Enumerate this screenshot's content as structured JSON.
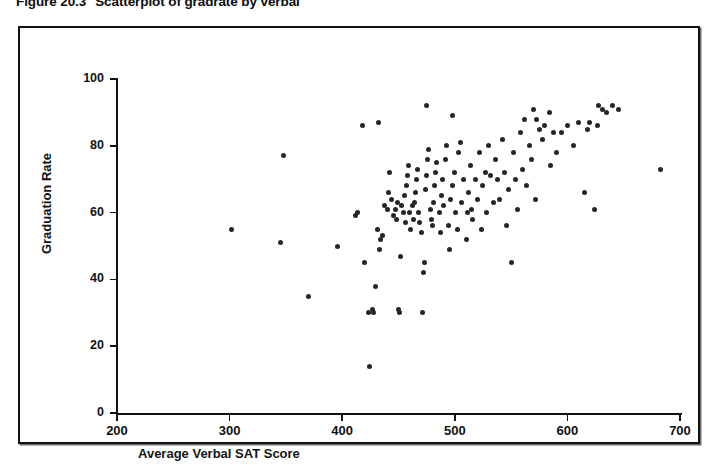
{
  "caption": {
    "number": "Figure 20.3",
    "text": "Scatterplot of gradrate by verbal"
  },
  "chart_data": {
    "type": "scatter",
    "title": "Scatterplot of gradrate by verbal",
    "xlabel": "Average Verbal SAT Score",
    "ylabel": "Graduation Rate",
    "xlim": [
      200,
      700
    ],
    "ylim": [
      0,
      100
    ],
    "xticks": [
      200,
      300,
      400,
      500,
      600,
      700
    ],
    "yticks": [
      0,
      20,
      40,
      60,
      80,
      100
    ],
    "grid": false,
    "legend": "none",
    "marker": {
      "shape": "circle",
      "color": "#262626",
      "size_px": 5
    },
    "n_points": 137,
    "points": [
      [
        348,
        77
      ],
      [
        418,
        86
      ],
      [
        432,
        87
      ],
      [
        475,
        92
      ],
      [
        498,
        89
      ],
      [
        570,
        91
      ],
      [
        573,
        88
      ],
      [
        584,
        90
      ],
      [
        588,
        84
      ],
      [
        628,
        92
      ],
      [
        631,
        91
      ],
      [
        635,
        90
      ],
      [
        640,
        92
      ],
      [
        645,
        91
      ],
      [
        302,
        55
      ],
      [
        370,
        35
      ],
      [
        345,
        51
      ],
      [
        396,
        50
      ],
      [
        412,
        59
      ],
      [
        414,
        60
      ],
      [
        420,
        45
      ],
      [
        423,
        30
      ],
      [
        424,
        14
      ],
      [
        427,
        31
      ],
      [
        428,
        30
      ],
      [
        430,
        38
      ],
      [
        431,
        55
      ],
      [
        433,
        49
      ],
      [
        434,
        52
      ],
      [
        436,
        53
      ],
      [
        438,
        62
      ],
      [
        440,
        61
      ],
      [
        441,
        66
      ],
      [
        442,
        72
      ],
      [
        444,
        64
      ],
      [
        446,
        59
      ],
      [
        447,
        61
      ],
      [
        448,
        58
      ],
      [
        449,
        63
      ],
      [
        450,
        31
      ],
      [
        451,
        30
      ],
      [
        452,
        47
      ],
      [
        453,
        62
      ],
      [
        454,
        60
      ],
      [
        455,
        65
      ],
      [
        456,
        57
      ],
      [
        457,
        68
      ],
      [
        458,
        71
      ],
      [
        459,
        74
      ],
      [
        460,
        60
      ],
      [
        461,
        55
      ],
      [
        462,
        62
      ],
      [
        463,
        58
      ],
      [
        464,
        63
      ],
      [
        465,
        66
      ],
      [
        466,
        70
      ],
      [
        467,
        73
      ],
      [
        468,
        60
      ],
      [
        469,
        57
      ],
      [
        470,
        54
      ],
      [
        471,
        30
      ],
      [
        472,
        42
      ],
      [
        473,
        45
      ],
      [
        474,
        67
      ],
      [
        475,
        71
      ],
      [
        476,
        76
      ],
      [
        477,
        79
      ],
      [
        478,
        61
      ],
      [
        479,
        58
      ],
      [
        480,
        56
      ],
      [
        481,
        63
      ],
      [
        482,
        68
      ],
      [
        483,
        72
      ],
      [
        484,
        75
      ],
      [
        486,
        60
      ],
      [
        487,
        54
      ],
      [
        488,
        65
      ],
      [
        489,
        70
      ],
      [
        490,
        62
      ],
      [
        492,
        76
      ],
      [
        493,
        80
      ],
      [
        494,
        56
      ],
      [
        495,
        49
      ],
      [
        496,
        64
      ],
      [
        498,
        68
      ],
      [
        500,
        72
      ],
      [
        501,
        60
      ],
      [
        502,
        55
      ],
      [
        503,
        78
      ],
      [
        505,
        81
      ],
      [
        506,
        63
      ],
      [
        508,
        70
      ],
      [
        510,
        52
      ],
      [
        511,
        60
      ],
      [
        512,
        66
      ],
      [
        514,
        74
      ],
      [
        515,
        61
      ],
      [
        516,
        58
      ],
      [
        518,
        70
      ],
      [
        520,
        64
      ],
      [
        522,
        78
      ],
      [
        524,
        55
      ],
      [
        525,
        68
      ],
      [
        527,
        72
      ],
      [
        528,
        60
      ],
      [
        530,
        80
      ],
      [
        532,
        71
      ],
      [
        534,
        63
      ],
      [
        536,
        76
      ],
      [
        538,
        70
      ],
      [
        540,
        64
      ],
      [
        542,
        82
      ],
      [
        544,
        72
      ],
      [
        546,
        56
      ],
      [
        548,
        67
      ],
      [
        550,
        45
      ],
      [
        552,
        78
      ],
      [
        554,
        70
      ],
      [
        556,
        61
      ],
      [
        558,
        84
      ],
      [
        560,
        73
      ],
      [
        562,
        88
      ],
      [
        564,
        68
      ],
      [
        566,
        80
      ],
      [
        568,
        76
      ],
      [
        572,
        64
      ],
      [
        575,
        85
      ],
      [
        578,
        82
      ],
      [
        580,
        86
      ],
      [
        585,
        74
      ],
      [
        590,
        78
      ],
      [
        595,
        84
      ],
      [
        600,
        86
      ],
      [
        605,
        80
      ],
      [
        610,
        87
      ],
      [
        615,
        66
      ],
      [
        618,
        85
      ],
      [
        620,
        87
      ],
      [
        624,
        61
      ],
      [
        627,
        86
      ],
      [
        683,
        73
      ]
    ]
  }
}
